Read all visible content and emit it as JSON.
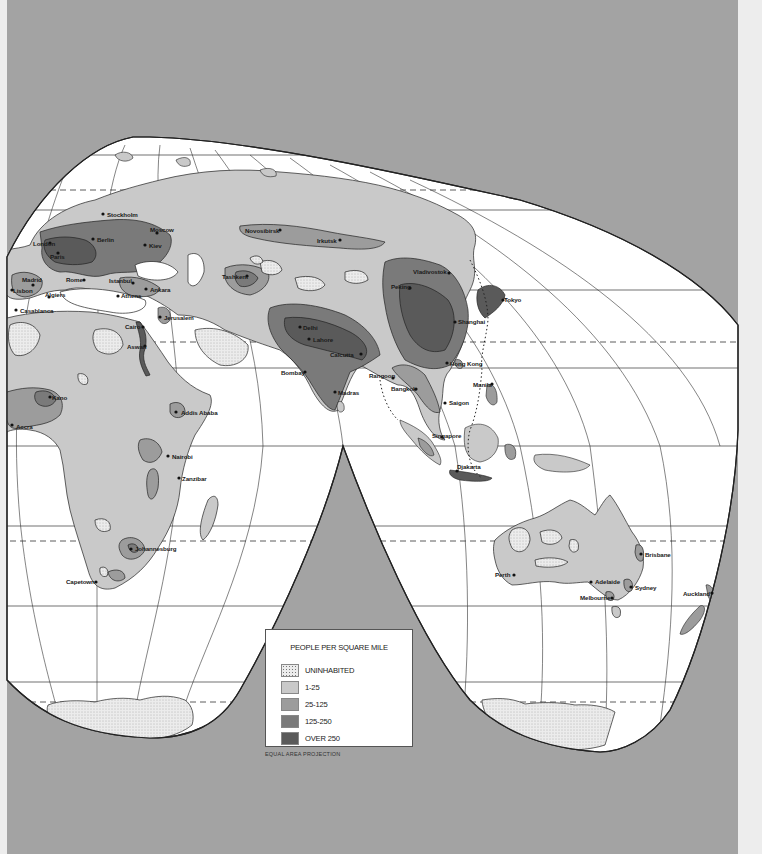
{
  "map": {
    "title": "World Population Density",
    "projection_note": "EQUAL AREA PROJECTION",
    "colors": {
      "background": "#a3a3a3",
      "ocean": "#ffffff",
      "uninhabited": "#ececec",
      "density_1_25": "#c9c9c9",
      "density_25_125": "#9c9c9c",
      "density_125_250": "#7a7a7a",
      "density_over_250": "#5a5a5a",
      "outline": "#222222"
    }
  },
  "legend": {
    "title": "PEOPLE PER SQUARE MILE",
    "items": [
      {
        "label": "UNINHABITED",
        "color": "#ececec",
        "pattern": "dots"
      },
      {
        "label": "1-25",
        "color": "#c9c9c9"
      },
      {
        "label": "25-125",
        "color": "#9c9c9c"
      },
      {
        "label": "125-250",
        "color": "#7a7a7a"
      },
      {
        "label": "OVER 250",
        "color": "#5a5a5a"
      }
    ]
  },
  "cities": [
    {
      "name": "Stockholm",
      "x": 103,
      "y": 214,
      "lx": 107,
      "ly": 217
    },
    {
      "name": "London",
      "x": 50,
      "y": 243,
      "lx": 33,
      "ly": 246
    },
    {
      "name": "Berlin",
      "x": 93,
      "y": 239,
      "lx": 97,
      "ly": 242
    },
    {
      "name": "Moscow",
      "x": 157,
      "y": 233,
      "lx": 150,
      "ly": 232
    },
    {
      "name": "Kiev",
      "x": 145,
      "y": 245,
      "lx": 149,
      "ly": 248
    },
    {
      "name": "Paris",
      "x": 58,
      "y": 253,
      "lx": 50,
      "ly": 259
    },
    {
      "name": "Novosibirsk",
      "x": 280,
      "y": 230,
      "lx": 245,
      "ly": 233
    },
    {
      "name": "Irkutsk",
      "x": 340,
      "y": 240,
      "lx": 317,
      "ly": 243
    },
    {
      "name": "Madrid",
      "x": 33,
      "y": 285,
      "lx": 22,
      "ly": 282
    },
    {
      "name": "Lisbon",
      "x": 12,
      "y": 290,
      "lx": 13,
      "ly": 293
    },
    {
      "name": "Rome",
      "x": 84,
      "y": 280,
      "lx": 66,
      "ly": 282
    },
    {
      "name": "Istanbul",
      "x": 133,
      "y": 283,
      "lx": 109,
      "ly": 283
    },
    {
      "name": "Ankara",
      "x": 146,
      "y": 289,
      "lx": 150,
      "ly": 292
    },
    {
      "name": "Algiers",
      "x": 49,
      "y": 297,
      "lx": 45,
      "ly": 297
    },
    {
      "name": "Athens",
      "x": 118,
      "y": 296,
      "lx": 121,
      "ly": 298
    },
    {
      "name": "Casablanca",
      "x": 16,
      "y": 310,
      "lx": 20,
      "ly": 313
    },
    {
      "name": "Jerusalem",
      "x": 160,
      "y": 317,
      "lx": 164,
      "ly": 320
    },
    {
      "name": "Cairo",
      "x": 143,
      "y": 327,
      "lx": 125,
      "ly": 329
    },
    {
      "name": "Aswan",
      "x": 145,
      "y": 346,
      "lx": 127,
      "ly": 349
    },
    {
      "name": "Tashkent",
      "x": 247,
      "y": 276,
      "lx": 222,
      "ly": 279
    },
    {
      "name": "Delhi",
      "x": 300,
      "y": 327,
      "lx": 303,
      "ly": 330
    },
    {
      "name": "Lahore",
      "x": 309,
      "y": 339,
      "lx": 313,
      "ly": 342
    },
    {
      "name": "Calcutta",
      "x": 361,
      "y": 354,
      "lx": 330,
      "ly": 357
    },
    {
      "name": "Bombay",
      "x": 305,
      "y": 372,
      "lx": 281,
      "ly": 375
    },
    {
      "name": "Madras",
      "x": 335,
      "y": 392,
      "lx": 338,
      "ly": 395
    },
    {
      "name": "Peking",
      "x": 410,
      "y": 288,
      "lx": 391,
      "ly": 289
    },
    {
      "name": "Vladivostok",
      "x": 449,
      "y": 273,
      "lx": 413,
      "ly": 274
    },
    {
      "name": "Tokyo",
      "x": 503,
      "y": 300,
      "lx": 504,
      "ly": 302
    },
    {
      "name": "Shanghai",
      "x": 455,
      "y": 322,
      "lx": 458,
      "ly": 324
    },
    {
      "name": "Hong Kong",
      "x": 447,
      "y": 363,
      "lx": 450,
      "ly": 366
    },
    {
      "name": "Rangoon",
      "x": 393,
      "y": 378,
      "lx": 369,
      "ly": 378
    },
    {
      "name": "Bangkok",
      "x": 416,
      "y": 389,
      "lx": 391,
      "ly": 391
    },
    {
      "name": "Manila",
      "x": 492,
      "y": 384,
      "lx": 473,
      "ly": 387
    },
    {
      "name": "Saigon",
      "x": 445,
      "y": 403,
      "lx": 449,
      "ly": 405
    },
    {
      "name": "Singapore",
      "x": 442,
      "y": 437,
      "lx": 432,
      "ly": 438
    },
    {
      "name": "Djakarta",
      "x": 457,
      "y": 471,
      "lx": 457,
      "ly": 469
    },
    {
      "name": "Accra",
      "x": 12,
      "y": 425,
      "lx": 16,
      "ly": 429
    },
    {
      "name": "Kano",
      "x": 50,
      "y": 397,
      "lx": 52,
      "ly": 400
    },
    {
      "name": "Addis Ababa",
      "x": 176,
      "y": 412,
      "lx": 181,
      "ly": 415
    },
    {
      "name": "Nairobi",
      "x": 168,
      "y": 456,
      "lx": 172,
      "ly": 459
    },
    {
      "name": "Zanzibar",
      "x": 179,
      "y": 478,
      "lx": 182,
      "ly": 481
    },
    {
      "name": "Johannesburg",
      "x": 131,
      "y": 549,
      "lx": 135,
      "ly": 551
    },
    {
      "name": "Capetown",
      "x": 96,
      "y": 582,
      "lx": 66,
      "ly": 584
    },
    {
      "name": "Perth",
      "x": 514,
      "y": 575,
      "lx": 495,
      "ly": 577
    },
    {
      "name": "Adelaide",
      "x": 591,
      "y": 582,
      "lx": 595,
      "ly": 584
    },
    {
      "name": "Melbourne",
      "x": 612,
      "y": 598,
      "lx": 580,
      "ly": 600
    },
    {
      "name": "Sydney",
      "x": 631,
      "y": 587,
      "lx": 635,
      "ly": 590
    },
    {
      "name": "Brisbane",
      "x": 641,
      "y": 554,
      "lx": 645,
      "ly": 557
    },
    {
      "name": "Auckland",
      "x": 712,
      "y": 593,
      "lx": 683,
      "ly": 596
    }
  ]
}
